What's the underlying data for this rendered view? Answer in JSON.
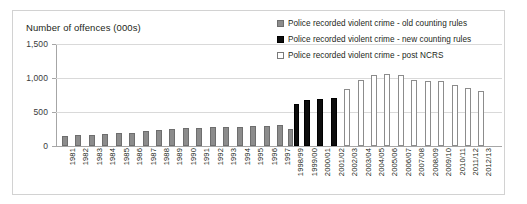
{
  "chart_data": {
    "type": "bar",
    "title": "",
    "xlabel": "",
    "ylabel": "Number of offences (000s)",
    "ylim": [
      0,
      1500
    ],
    "yticks": [
      0,
      500,
      1000,
      1500
    ],
    "ytick_labels": [
      "0",
      "500",
      "1,000",
      "1,500"
    ],
    "grid": true,
    "legend_position": "top-right",
    "categories": [
      "1981",
      "1982",
      "1983",
      "1984",
      "1985",
      "1986",
      "1987",
      "1988",
      "1989",
      "1990",
      "1991",
      "1992",
      "1993",
      "1994",
      "1995",
      "1996",
      "1997",
      "1998/99",
      "1999/00",
      "2000/01",
      "2001/02",
      "2002/03",
      "2003/04",
      "2004/05",
      "2005/06",
      "2006/07",
      "2007/08",
      "2008/09",
      "2009/10",
      "2010/11",
      "2011/12",
      "2012/13"
    ],
    "series": [
      {
        "name": "Police recorded violent crime - old counting rules",
        "color": "#8c8c8c",
        "values": [
          150,
          160,
          165,
          175,
          185,
          195,
          215,
          235,
          250,
          260,
          265,
          275,
          280,
          285,
          290,
          300,
          305,
          250,
          null,
          null,
          null,
          null,
          null,
          null,
          null,
          null,
          null,
          null,
          null,
          null,
          null,
          null
        ]
      },
      {
        "name": "Police recorded violent crime - new counting rules",
        "color": "#0d0d0d",
        "values": [
          null,
          null,
          null,
          null,
          null,
          null,
          null,
          null,
          null,
          null,
          null,
          null,
          null,
          null,
          null,
          null,
          null,
          615,
          680,
          690,
          705,
          null,
          null,
          null,
          null,
          null,
          null,
          null,
          null,
          null,
          null,
          null
        ]
      },
      {
        "name": "Police recorded violent crime - post NCRS",
        "color": "#ffffff",
        "values": [
          null,
          null,
          null,
          null,
          null,
          null,
          null,
          null,
          null,
          null,
          null,
          null,
          null,
          null,
          null,
          null,
          null,
          null,
          null,
          null,
          null,
          845,
          975,
          1045,
          1060,
          1045,
          975,
          950,
          950,
          895,
          860,
          815
        ]
      }
    ]
  },
  "legend": {
    "items": [
      {
        "label": "Police recorded violent crime - old counting rules",
        "swatch": "old"
      },
      {
        "label": "Police recorded violent crime - new counting rules",
        "swatch": "new"
      },
      {
        "label": "Police recorded violent crime - post NCRS",
        "swatch": "ncrs"
      }
    ]
  },
  "axis": {
    "y_title": "Number of offences (000s)"
  }
}
